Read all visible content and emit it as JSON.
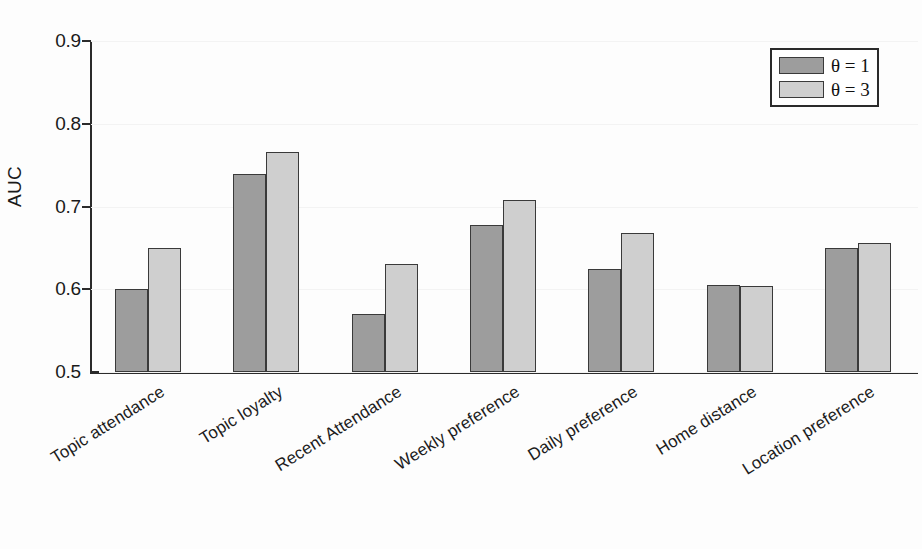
{
  "chart_data": {
    "type": "bar",
    "title": "",
    "xlabel": "",
    "ylabel": "AUC",
    "ylim": [
      0.5,
      0.9
    ],
    "ytick_labels": [
      "0.5",
      "0.6",
      "0.7",
      "0.8",
      "0.9"
    ],
    "ytick_values": [
      0.5,
      0.6,
      0.7,
      0.8,
      0.9
    ],
    "grid": false,
    "legend_position": "top-right",
    "categories": [
      "Topic attendance",
      "Topic loyalty",
      "Recent Attendance",
      "Weekly preference",
      "Daily preference",
      "Home distance",
      "Location preference"
    ],
    "series": [
      {
        "name": "θ = 1",
        "color": "#9d9d9d",
        "values": [
          0.6,
          0.739,
          0.57,
          0.678,
          0.625,
          0.605,
          0.65
        ]
      },
      {
        "name": "θ = 3",
        "color": "#cfcfcf",
        "values": [
          0.65,
          0.766,
          0.63,
          0.708,
          0.668,
          0.604,
          0.656
        ]
      }
    ]
  },
  "legend": {
    "entries": [
      {
        "label": "θ = 1",
        "swatch": "s0"
      },
      {
        "label": "θ = 3",
        "swatch": "s1"
      }
    ]
  },
  "axis": {
    "y_title": "AUC"
  }
}
